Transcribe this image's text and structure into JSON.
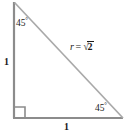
{
  "figure": {
    "type": "right-triangle-45-45-90",
    "background_color": "#ffffff",
    "leg_color": "#8c8c8c",
    "hypotenuse_color": "#a8a8a8",
    "text_color": "#1a1a1a",
    "angles": {
      "apex": "45",
      "bottom_right": "45",
      "bottom_left": "90",
      "degree_symbol": "°"
    },
    "sides": {
      "left_leg": "1",
      "bottom_leg": "1",
      "hypotenuse": {
        "variable": "r",
        "equals": "=",
        "surd": "√",
        "radicand": "2"
      }
    },
    "geometry": {
      "apex": [
        14,
        2
      ],
      "bottom_left": [
        14,
        118
      ],
      "bottom_right": [
        123,
        118
      ],
      "right_angle_marker_size": 10
    }
  }
}
